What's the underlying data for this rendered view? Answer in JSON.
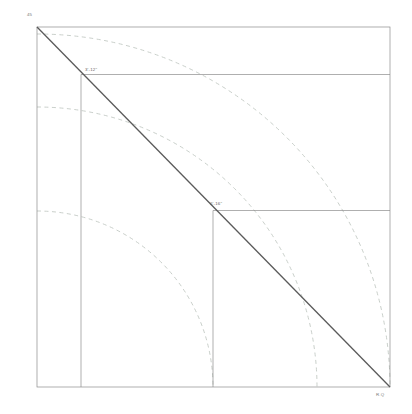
{
  "drawing": {
    "background_color": "#ffffff",
    "frame": {
      "x": 37,
      "y": 27,
      "width": 353,
      "height": 360,
      "stroke": "#8c8c8c",
      "stroke_width": 0.7
    },
    "diagonal": {
      "name": "hypotenuse-45-degree",
      "x1": 37,
      "y1": 27,
      "x2": 390,
      "y2": 387,
      "stroke": "#5a5a5a",
      "stroke_width": 1.3
    },
    "horizontal_lines": [
      {
        "id": "upper-offset-line",
        "y": 74.5,
        "x1": 81,
        "x2": 390,
        "stroke": "#8c8c8c",
        "stroke_width": 0.7
      },
      {
        "id": "lower-offset-line",
        "y": 210.5,
        "x1": 213,
        "x2": 390,
        "stroke": "#8c8c8c",
        "stroke_width": 0.7
      }
    ],
    "vertical_lines": [
      {
        "id": "upper-drop-line",
        "x": 81,
        "y1": 74.5,
        "y2": 387,
        "stroke": "#8c8c8c",
        "stroke_width": 0.7
      },
      {
        "id": "lower-drop-line",
        "x": 213,
        "y1": 210.5,
        "y2": 387,
        "stroke": "#8c8c8c",
        "stroke_width": 0.7
      }
    ],
    "arcs": [
      {
        "id": "outer-radius-arc",
        "center_x": 37,
        "center_y": 387,
        "radius": 353,
        "stroke": "#c3c9c4",
        "stroke_width": 0.9,
        "dash": "4 3.5"
      },
      {
        "id": "inner-radius-arc",
        "center_x": 37,
        "center_y": 387,
        "radius": 280,
        "stroke": "#c3c9c4",
        "stroke_width": 0.9,
        "dash": "4 3.5"
      },
      {
        "id": "mid-radius-arc",
        "center_x": 37,
        "center_y": 387,
        "radius": 176,
        "stroke": "#c3c9c4",
        "stroke_width": 0.9,
        "dash": "4 3.5"
      }
    ]
  },
  "annotations": {
    "corner_angle": "45",
    "dimension_upper": "3'-12\"",
    "dimension_lower": "6'-16\"",
    "origin_mark": "R.Q"
  }
}
